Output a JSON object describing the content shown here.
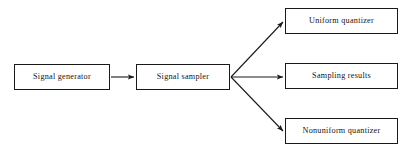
{
  "diagram": {
    "background_color": "#ffffff",
    "stroke_color": "#1a1a1a",
    "text_color": "#141414",
    "nodes": [
      {
        "id": "signal-generator",
        "label": "Signal generator",
        "x": 14,
        "y": 64,
        "w": 96,
        "h": 26
      },
      {
        "id": "signal-sampler",
        "label": "Signal sampler",
        "x": 136,
        "y": 64,
        "w": 94,
        "h": 26
      },
      {
        "id": "uniform-quantizer",
        "label": "Uniform quantizer",
        "x": 285,
        "y": 8,
        "w": 113,
        "h": 26
      },
      {
        "id": "sampling-results",
        "label": "Sampling results",
        "x": 285,
        "y": 63,
        "w": 113,
        "h": 26
      },
      {
        "id": "nonuniform-quantizer",
        "label": "Nonuniform  quantizer",
        "x": 285,
        "y": 118,
        "w": 113,
        "h": 26
      }
    ],
    "edges": [
      {
        "id": "generator-to-sampler",
        "from": "signal-generator",
        "to": "signal-sampler",
        "x1": 111,
        "y1": 77,
        "x2": 134,
        "y2": 77
      },
      {
        "id": "sampler-to-uniform-quantizer",
        "from": "signal-sampler",
        "to": "uniform-quantizer",
        "x1": 231,
        "y1": 77,
        "x2": 283,
        "y2": 22
      },
      {
        "id": "sampler-to-sampling-results",
        "from": "signal-sampler",
        "to": "sampling-results",
        "x1": 231,
        "y1": 77,
        "x2": 283,
        "y2": 77
      },
      {
        "id": "sampler-to-nonuniform-quantizer",
        "from": "signal-sampler",
        "to": "nonuniform-quantizer",
        "x1": 231,
        "y1": 77,
        "x2": 283,
        "y2": 131
      }
    ]
  }
}
